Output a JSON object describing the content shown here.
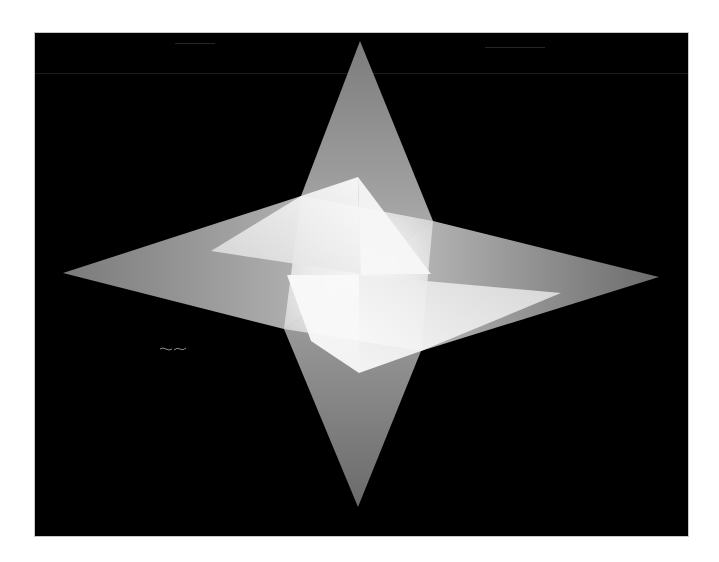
{
  "image": {
    "subject": "four-pointed star",
    "description": "Gray four-pointed star on black background with a bright white pinwheel of overlapping panels at the center",
    "colors": {
      "background": "#000000",
      "page": "#ffffff",
      "frame_border": "#c8c8c8",
      "arm_gray": "#8a8a8a",
      "arm_dark": "#6e6e6e",
      "highlight": "#ffffff",
      "panel_light": "#f2f2f2"
    },
    "star_points": {
      "top": [
        359,
        40
      ],
      "right": [
        658,
        276
      ],
      "bottom": [
        357,
        506
      ],
      "left": [
        62,
        272
      ]
    },
    "inner_vertices": {
      "upper_left": [
        300,
        195
      ],
      "upper_right": [
        432,
        220
      ],
      "lower_right": [
        420,
        350
      ],
      "lower_left": [
        283,
        328
      ]
    },
    "bright_panels": {
      "upper": [
        [
          357,
          176
        ],
        [
          430,
          273
        ],
        [
          300,
          273
        ]
      ],
      "lower": [
        [
          286,
          274
        ],
        [
          358,
          372
        ],
        [
          420,
          300
        ]
      ]
    }
  }
}
